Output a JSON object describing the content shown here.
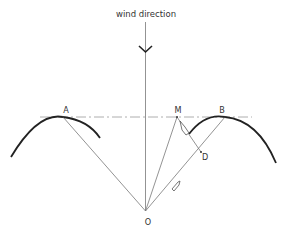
{
  "diagram": {
    "title": "wind direction",
    "labels": {
      "A": "A",
      "B": "B",
      "M": "M",
      "D": "D",
      "O": "O"
    },
    "points": {
      "A": [
        63,
        117
      ],
      "B": [
        225,
        117
      ],
      "M": [
        177,
        117
      ],
      "D": [
        201,
        152
      ],
      "O": [
        145,
        211
      ]
    },
    "lines": [
      "O-A",
      "O-M",
      "O-B",
      "M-D",
      "wind-axis (vertical through O)",
      "horizontal dash-dot through A, M, B"
    ],
    "elements": {
      "wind_arrow": "downward arrow on vertical axis",
      "left_arc": "wave crest through A",
      "right_arc": "wave crest through B",
      "boat_on_MD": "small boat symbol on segment M-D",
      "boat_on_OB": "small boat symbol on segment O-B"
    }
  }
}
